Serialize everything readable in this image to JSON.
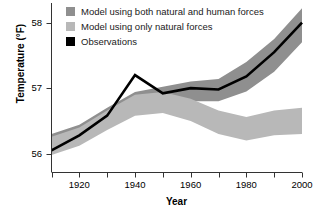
{
  "chart_data": {
    "type": "area",
    "title": "",
    "xlabel": "Year",
    "ylabel": "Temperature (°F)",
    "xlim": [
      1910,
      2000
    ],
    "ylim": [
      55.72,
      58.3
    ],
    "grid": false,
    "legend_position": "top-left-inside",
    "x_ticks_major": [
      1920,
      1940,
      1960,
      1980,
      2000
    ],
    "x_ticks_minor": [
      1910,
      1930,
      1950,
      1970,
      1990
    ],
    "y_ticks": [
      56,
      57,
      58
    ],
    "x_tick_labels": [
      "1920",
      "1940",
      "1960",
      "1980",
      "2000"
    ],
    "y_tick_labels": [
      "56",
      "57",
      "58"
    ],
    "x": [
      1910,
      1920,
      1930,
      1940,
      1950,
      1960,
      1970,
      1980,
      1990,
      2000
    ],
    "series": [
      {
        "name": "Model using both natural and human forces",
        "kind": "band",
        "color": "#8f8f8f",
        "lower": [
          56.02,
          56.16,
          56.4,
          56.62,
          56.72,
          56.8,
          56.8,
          56.95,
          57.25,
          57.7
        ],
        "upper": [
          56.3,
          56.44,
          56.7,
          56.94,
          57.02,
          57.1,
          57.14,
          57.4,
          57.75,
          58.22
        ]
      },
      {
        "name": "Model using only natural forces",
        "kind": "band",
        "color": "#b8b8b8",
        "lower": [
          55.98,
          56.12,
          56.36,
          56.58,
          56.62,
          56.5,
          56.3,
          56.2,
          56.28,
          56.3
        ],
        "upper": [
          56.26,
          56.4,
          56.66,
          56.9,
          56.94,
          56.84,
          56.66,
          56.56,
          56.66,
          56.7
        ]
      },
      {
        "name": "Observations",
        "kind": "line",
        "color": "#000000",
        "values": [
          56.05,
          56.28,
          56.58,
          57.2,
          56.92,
          57.0,
          56.98,
          57.18,
          57.55,
          58.0
        ]
      }
    ]
  },
  "legend": {
    "items": [
      {
        "label": "Model using both natural and human forces",
        "color": "#8f8f8f"
      },
      {
        "label": "Model using only natural forces",
        "color": "#b8b8b8"
      },
      {
        "label": "Observations",
        "color": "#000000"
      }
    ]
  },
  "axes": {
    "y_title": "Temperature (°F)",
    "x_title": "Year"
  }
}
